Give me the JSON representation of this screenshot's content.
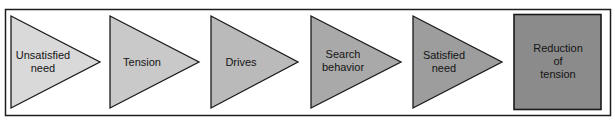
{
  "diagram": {
    "title": "",
    "frame": {
      "stroke": "#1e1e1e"
    },
    "steps": [
      {
        "label": "Unsatisfied\nneed",
        "shape": "triangle-arrow",
        "fill": "#d9d9d9"
      },
      {
        "label": "Tension",
        "shape": "triangle-arrow",
        "fill": "#c9c9c9"
      },
      {
        "label": "Drives",
        "shape": "triangle-arrow",
        "fill": "#bababa"
      },
      {
        "label": "Search\nbehavior",
        "shape": "triangle-arrow",
        "fill": "#a9a9a9"
      },
      {
        "label": "Satisfied\nneed",
        "shape": "triangle-arrow",
        "fill": "#9d9d9d"
      },
      {
        "label": "Reduction\nof\ntension",
        "shape": "box",
        "fill": "#8b8b8b"
      }
    ]
  }
}
